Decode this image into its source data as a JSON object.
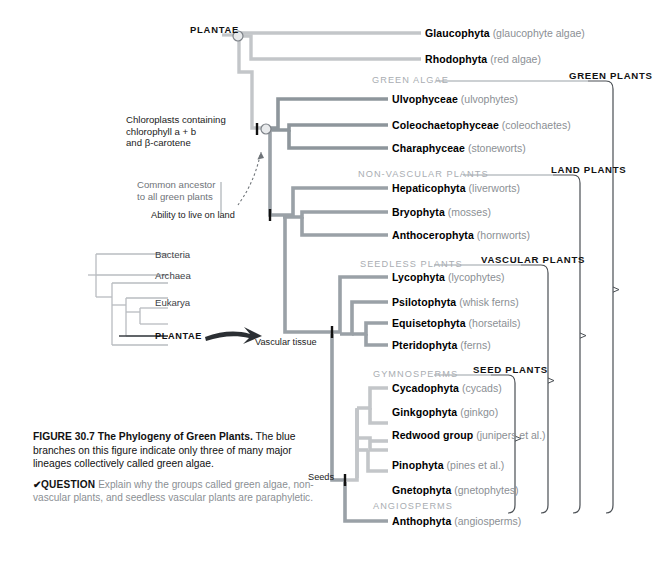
{
  "figure": {
    "number": "FIGURE 30.7",
    "title": "The Phylogeny of Green Plants.",
    "body": "The blue branches on this figure indicate only three of many major lineages collectively called green algae.",
    "question_check": "✔",
    "question_label": "QUESTION",
    "question_text": "Explain why the groups called green algae, non-vascular plants, and seedless vascular plants are paraphyletic."
  },
  "root_label": "PLANTAE",
  "taxa": [
    {
      "name": "Glaucophyta",
      "common": "(glaucophyte algae)",
      "color": "#c3c6c9"
    },
    {
      "name": "Rhodophyta",
      "common": "(red algae)",
      "color": "#c3c6c9"
    },
    {
      "name": "Ulvophyceae",
      "common": "(ulvophytes)",
      "color": "#8e969c"
    },
    {
      "name": "Coleochaetophyceae",
      "common": "(coleochaetes)",
      "color": "#8e969c"
    },
    {
      "name": "Charaphyceae",
      "common": "(stoneworts)",
      "color": "#8e969c"
    },
    {
      "name": "Hepaticophyta",
      "common": "(liverworts)",
      "color": "#9aa1a7"
    },
    {
      "name": "Bryophyta",
      "common": "(mosses)",
      "color": "#9aa1a7"
    },
    {
      "name": "Anthocerophyta",
      "common": "(hornworts)",
      "color": "#9aa1a7"
    },
    {
      "name": "Lycophyta",
      "common": "(lycophytes)",
      "color": "#9aa1a7"
    },
    {
      "name": "Psilotophyta",
      "common": "(whisk ferns)",
      "color": "#9aa1a7"
    },
    {
      "name": "Equisetophyta",
      "common": "(horsetails)",
      "color": "#9aa1a7"
    },
    {
      "name": "Pteridophyta",
      "common": "(ferns)",
      "color": "#9aa1a7"
    },
    {
      "name": "Cycadophyta",
      "common": "(cycads)",
      "color": "#c3c6c9"
    },
    {
      "name": "Ginkgophyta",
      "common": "(ginkgo)",
      "color": "#c3c6c9"
    },
    {
      "name": "Redwood group",
      "common": "(junipers et al.)",
      "color": "#c3c6c9"
    },
    {
      "name": "Pinophyta",
      "common": "(pines et al.)",
      "color": "#c3c6c9"
    },
    {
      "name": "Gnetophyta",
      "common": "(gnetophytes)",
      "color": "#c3c6c9"
    },
    {
      "name": "Anthophyta",
      "common": "(angiosperms)",
      "color": "#9aa1a7"
    }
  ],
  "group_labels": [
    {
      "text": "GREEN ALGAE"
    },
    {
      "text": "NON-VASCULAR PLANTS"
    },
    {
      "text": "SEEDLESS PLANTS"
    },
    {
      "text": "GYMNOSPERMS"
    },
    {
      "text": "ANGIOSPERMS"
    }
  ],
  "bracket_labels": [
    {
      "text": "GREEN PLANTS"
    },
    {
      "text": "LAND PLANTS"
    },
    {
      "text": "VASCULAR PLANTS"
    },
    {
      "text": "SEED PLANTS"
    }
  ],
  "annotations": {
    "chloroplasts_l1": "Chloroplasts containing",
    "chloroplasts_l2": "chlorophyll a + b",
    "chloroplasts_l3": "and β-carotene",
    "ancestor_l1": "Common ancestor",
    "ancestor_l2": "to all green plants",
    "land": "Ability to live on land",
    "vascular": "Vascular tissue",
    "seeds": "Seeds"
  },
  "inset_tree": {
    "items": [
      "Bacteria",
      "Archaea",
      "Eukarya"
    ],
    "highlight": "PLANTAE"
  },
  "colors": {
    "light_branch": "#c3c6c9",
    "mid_branch": "#9aa1a7",
    "dark_branch": "#8e969c",
    "group_label": "#a9adb2",
    "bracket": "#4a4f54",
    "inset_line": "#b8bcc0",
    "arrow": "#2b2f33"
  }
}
